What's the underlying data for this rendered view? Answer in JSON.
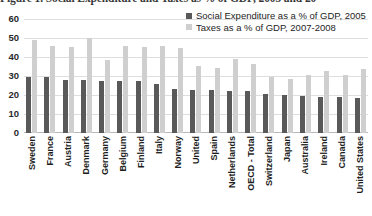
{
  "figure": {
    "title": "Figure 1. Social Expenditure and Taxes as % of GDP, 2005 and 20",
    "title_truncated": true
  },
  "legend": {
    "position": "top-right",
    "items": [
      {
        "label": "Social Expenditure as a % of GDP, 2005",
        "color": "#595959",
        "swatch": "square-swatch"
      },
      {
        "label": "Taxes as a % of GDP, 2007-2008",
        "color": "#cfcfcf",
        "swatch": "square-swatch"
      }
    ]
  },
  "axis": {
    "y_ticks": [
      "60",
      "50",
      "40",
      "30",
      "20",
      "10",
      "0"
    ]
  },
  "chart_data": {
    "type": "bar",
    "title": "Figure 1. Social Expenditure and Taxes as % of GDP, 2005 and 20",
    "xlabel": "",
    "ylabel": "",
    "ylim": [
      0,
      60
    ],
    "ytick_step": 10,
    "grid": true,
    "legend_position": "top-right",
    "categories": [
      "Sweden",
      "France",
      "Austria",
      "Denmark",
      "Germany",
      "Belgium",
      "Finland",
      "Italy",
      "Norway",
      "United",
      "Spain",
      "Netherlands",
      "OECD - Total",
      "Switzerland",
      "Japan",
      "Australia",
      "Ireland",
      "Canada",
      "United States"
    ],
    "series": [
      {
        "name": "Social Expenditure as a % of GDP, 2005",
        "color": "#595959",
        "values": [
          29.5,
          29.5,
          28,
          28,
          27.5,
          27.5,
          27.5,
          26,
          23,
          22.5,
          22.5,
          22,
          22,
          20.5,
          20,
          19.5,
          19,
          19,
          18.5
        ]
      },
      {
        "name": "Taxes as a % of GDP, 2007-2008",
        "color": "#cfcfcf",
        "values": [
          49,
          46,
          45.5,
          50,
          38.5,
          46,
          45.5,
          46,
          44.5,
          35.5,
          34,
          39,
          36.5,
          29.5,
          28.5,
          30.5,
          32.5,
          30.5,
          33.5
        ]
      }
    ]
  }
}
